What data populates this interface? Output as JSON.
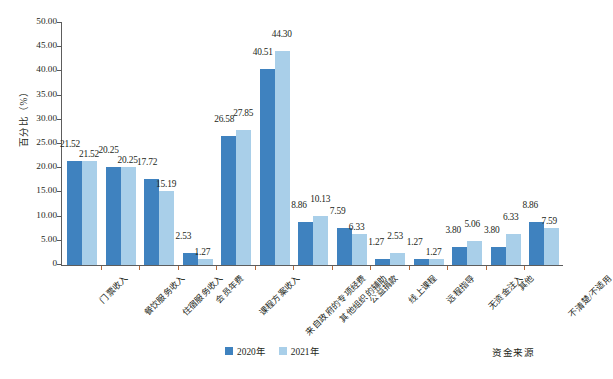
{
  "chart_data": {
    "type": "bar",
    "title": "",
    "xlabel": "资金来源",
    "ylabel": "百分比（%）",
    "ylim": [
      0,
      50
    ],
    "ytick_labels": [
      "50.00",
      "45.00",
      "40.00",
      "35.00",
      "30.00",
      "25.00",
      "20.00",
      "15.00",
      "10.00",
      "5.00",
      "0"
    ],
    "ytick_values": [
      50,
      45,
      40,
      35,
      30,
      25,
      20,
      15,
      10,
      5,
      0
    ],
    "grid": false,
    "legend_position": "bottom-center",
    "categories": [
      "门票收入",
      "餐饮服务收入",
      "住宿服务收入",
      "会员年费",
      "课程方案收入",
      "来自政府的专项经费",
      "其他组织的辅助",
      "公益捐款",
      "线上课程",
      "远程指导",
      "无资金注入",
      "其他",
      "不清楚/不适用"
    ],
    "series": [
      {
        "name": "2020年",
        "color": "#3f82bf",
        "values": [
          21.52,
          20.25,
          17.72,
          2.53,
          26.58,
          40.51,
          8.86,
          7.59,
          1.27,
          1.27,
          3.8,
          3.8,
          8.86
        ],
        "labels": [
          "21.52",
          "20.25",
          "17.72",
          "2.53",
          "26.58",
          "40.51",
          "8.86",
          "7.59",
          "1.27",
          "1.27",
          "3.80",
          "3.80",
          "8.86"
        ]
      },
      {
        "name": "2021年",
        "color": "#a9cfe9",
        "values": [
          21.52,
          20.25,
          15.19,
          1.27,
          27.85,
          44.3,
          10.13,
          6.33,
          2.53,
          1.27,
          5.06,
          6.33,
          7.59
        ],
        "labels": [
          "21.52",
          "20.25",
          "15.19",
          "1.27",
          "27.85",
          "44.30",
          "10.13",
          "6.33",
          "2.53",
          "1.27",
          "5.06",
          "6.33",
          "7.59"
        ]
      }
    ]
  },
  "legend": {
    "items": [
      {
        "label": "2020年",
        "color": "#3f82bf"
      },
      {
        "label": "2021年",
        "color": "#a9cfe9"
      }
    ]
  },
  "colors": {
    "series_2020": "#3f82bf",
    "series_2021": "#a9cfe9",
    "axis": "#5d5d5d",
    "tick": "#b56a3a",
    "text": "#231f20",
    "background": "#ffffff"
  }
}
